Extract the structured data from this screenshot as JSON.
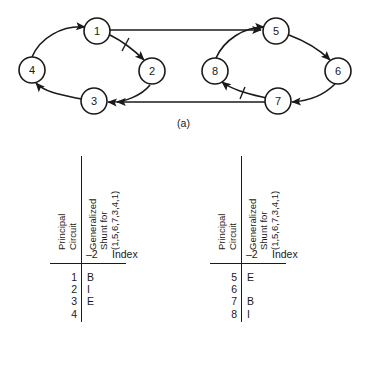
{
  "figure": {
    "panels": [
      {
        "key": "a",
        "caption": "(a)"
      },
      {
        "key": "b",
        "caption": "(b)"
      }
    ]
  },
  "graph": {
    "type": "directed-graph",
    "nodes": [
      {
        "id": "1",
        "label": "1",
        "cx": 97,
        "cy": 31
      },
      {
        "id": "2",
        "label": "2",
        "cx": 152,
        "cy": 71
      },
      {
        "id": "3",
        "label": "3",
        "cx": 94,
        "cy": 101
      },
      {
        "id": "4",
        "label": "4",
        "cx": 32,
        "cy": 70
      },
      {
        "id": "5",
        "label": "5",
        "cx": 276,
        "cy": 31
      },
      {
        "id": "6",
        "label": "6",
        "cx": 338,
        "cy": 71
      },
      {
        "id": "7",
        "label": "7",
        "cx": 278,
        "cy": 101
      },
      {
        "id": "8",
        "label": "8",
        "cx": 215,
        "cy": 71
      }
    ],
    "node_radius": 13,
    "edges": [
      {
        "from": "4",
        "to": "1",
        "style": "curve",
        "tick": false
      },
      {
        "from": "1",
        "to": "2",
        "style": "curve",
        "tick": true
      },
      {
        "from": "2",
        "to": "3",
        "style": "curve",
        "tick": false
      },
      {
        "from": "3",
        "to": "4",
        "style": "curve",
        "tick": false
      },
      {
        "from": "8",
        "to": "5",
        "style": "curve",
        "tick": false
      },
      {
        "from": "5",
        "to": "6",
        "style": "curve",
        "tick": false
      },
      {
        "from": "6",
        "to": "7",
        "style": "curve",
        "tick": false
      },
      {
        "from": "7",
        "to": "8",
        "style": "curve",
        "tick": true
      },
      {
        "from": "1",
        "to": "5",
        "style": "straight",
        "tick": false
      },
      {
        "from": "7",
        "to": "3",
        "style": "straight",
        "tick": false
      }
    ],
    "stroke_color": "#1a1a1a"
  },
  "tables": {
    "header_principal": "Principal\nCircuit",
    "header_shunt": "Generalized\nShunt for\n(1,5,6,7,3,4,1)",
    "index_label": "Index",
    "left": {
      "index_value": "–2",
      "circuit_rows": [
        "1",
        "2",
        "3",
        "4"
      ],
      "shunt_rows": [
        "B",
        "I",
        "E",
        ""
      ]
    },
    "right": {
      "index_value": "–2",
      "circuit_rows": [
        "5",
        "6",
        "7",
        "8"
      ],
      "shunt_rows": [
        "E",
        "",
        "B",
        "I"
      ]
    }
  }
}
